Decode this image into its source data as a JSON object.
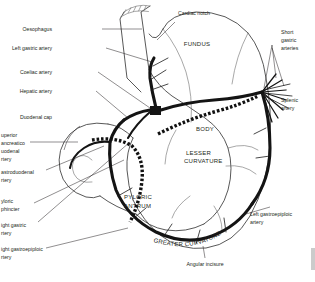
{
  "figure": {
    "background": "#ffffff",
    "ink_color": "#231f20",
    "artery_color": "#141414"
  },
  "region_labels": [
    {
      "id": "fundus",
      "text": "FUNDUS",
      "style": "caps"
    },
    {
      "id": "body",
      "text": "BODY",
      "style": "caps"
    },
    {
      "id": "lesser-curvature-1",
      "text": "LESSER",
      "style": "caps"
    },
    {
      "id": "lesser-curvature-2",
      "text": "CURVATURE",
      "style": "caps"
    },
    {
      "id": "pyloric-antrum-1",
      "text": "PYLORIC",
      "style": "caps"
    },
    {
      "id": "pyloric-antrum-2",
      "text": "ANTRUM",
      "style": "caps"
    },
    {
      "id": "greater-curvature",
      "text": "GREATER CURVATURE",
      "style": "caps-curved"
    }
  ],
  "leader_labels": {
    "oesophagus": "Oesophagus",
    "left_gastric_artery": "Left gastric artery",
    "coeliac_artery": "Coeliac artery",
    "hepatic_artery": "Hepatic artery",
    "duodenal_cap": "Duodenal cap",
    "cardiac_notch": "Cardiac notch",
    "short_gastric_arteries": [
      "Short",
      "gastric",
      "arteries"
    ],
    "splenic_artery": [
      "Splenic",
      "artery"
    ],
    "left_gastroepiploic_artery": [
      "Left gastroepiploic",
      "artery"
    ],
    "angular_incisure": "Angular incisure",
    "superior_pancreaticoduodenal_artery": [
      "uperior",
      "ancreatico",
      "uodenal",
      "rtery"
    ],
    "gastroduodenal_artery": [
      "astroduodenal",
      "rtery"
    ],
    "pyloric_sphincter": [
      "yloric",
      "phincter"
    ],
    "right_gastric_artery": [
      "ight gastric",
      "rtery"
    ],
    "right_gastroepiploic_artery": [
      "ight gastroepiploic",
      "rtery"
    ]
  }
}
